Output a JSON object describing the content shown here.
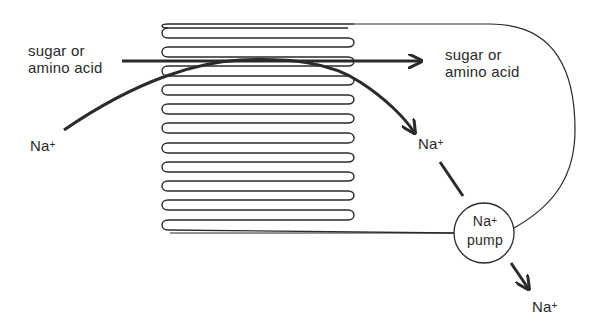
{
  "colors": {
    "ink": "#2a2a2a",
    "background": "#ffffff"
  },
  "labels": {
    "left_solute_line1": "sugar or",
    "left_solute_line2": "amino acid",
    "right_solute_line1": "sugar or",
    "right_solute_line2": "amino acid",
    "na_left": "Na",
    "na_mid": "Na",
    "na_bottom": "Na",
    "plus": "+",
    "pump_line1": "Na",
    "pump_line2": "pump"
  },
  "structure": {
    "microvilli_count": 11,
    "microvilli_tops_y": [
      28,
      47,
      66,
      85,
      104,
      123,
      143,
      162,
      181,
      200,
      220
    ],
    "microvilli_left_x": 162,
    "microvilli_right_x": 354,
    "pump_center": [
      484,
      233
    ],
    "pump_radius": 30
  }
}
